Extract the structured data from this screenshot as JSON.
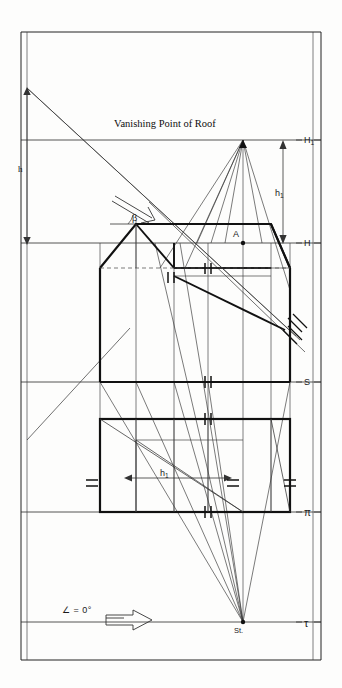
{
  "figure": {
    "kind": "perspective-construction-drawing",
    "title_annotation": "Vanishing Point of Roof",
    "labels": {
      "h": "h",
      "h1_upper": "h",
      "h1_upper_sub": "1",
      "h1_lower": "h",
      "h1_lower_sub": "1",
      "beta": "β",
      "point_a": "A",
      "station_point": "St.",
      "angle_note": "∠ = 0°"
    },
    "reference_lines": [
      {
        "name": "H1",
        "label": "H",
        "sub": "1",
        "y": 140
      },
      {
        "name": "H",
        "label": "H",
        "sub": "",
        "y": 243
      },
      {
        "name": "S",
        "label": "S",
        "sub": "",
        "y": 382
      },
      {
        "name": "pi",
        "label": "π",
        "sub": "",
        "y": 512
      },
      {
        "name": "tau",
        "label": "τ",
        "sub": "",
        "y": 622
      }
    ],
    "colors": {
      "ink": "#111111",
      "thin_ink": "#333333",
      "paper": "#fdfdfc",
      "frame": "#222222"
    },
    "stroke_widths": {
      "frame": 1.0,
      "reference": 0.8,
      "construction": 0.7,
      "object_heavy": 2.2
    },
    "points": {
      "vanishing_point_roof": {
        "x": 243,
        "y": 140
      },
      "station_point": {
        "x": 243,
        "y": 622
      },
      "point_A": {
        "x": 243,
        "y": 243
      },
      "left_h_top": {
        "x": 27,
        "y": 88
      },
      "left_h_bottom": {
        "x": 27,
        "y": 243
      }
    },
    "hatch_marks": {
      "double_tick_count": 8,
      "cross_tick_count": 2
    }
  }
}
